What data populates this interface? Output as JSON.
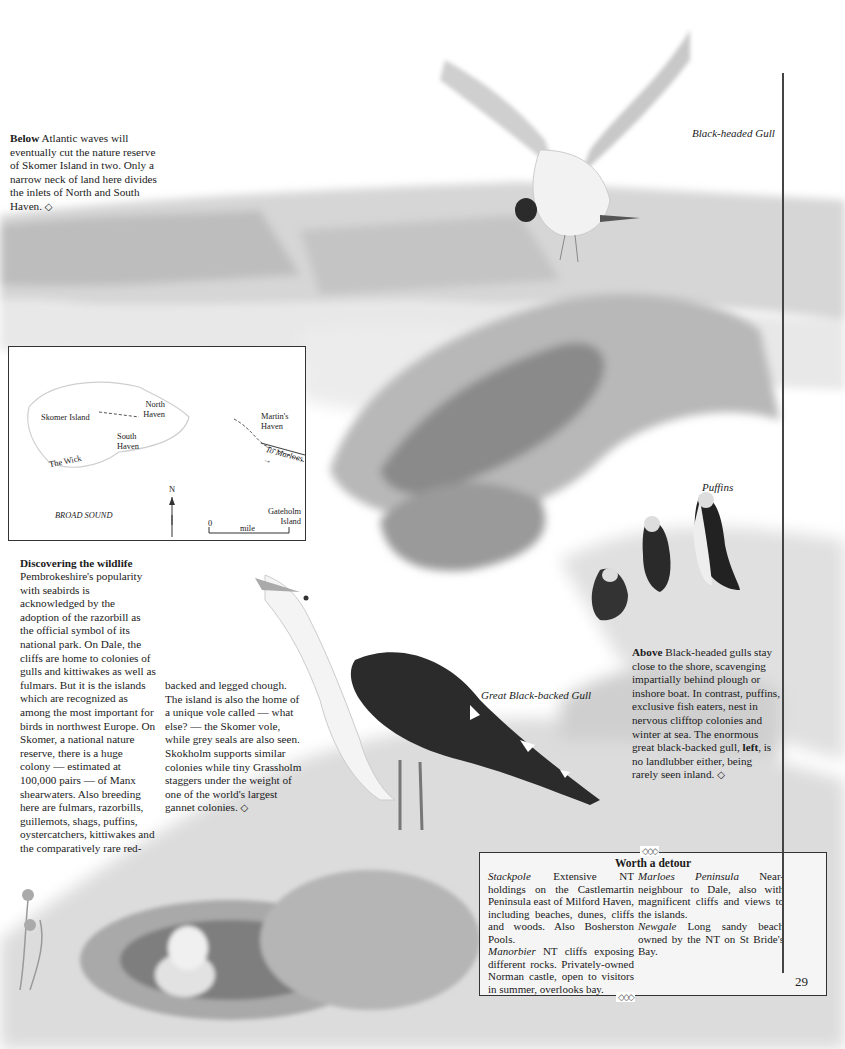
{
  "page": {
    "number": "29"
  },
  "captions": {
    "below": {
      "lead": "Below",
      "text": " Atlantic waves will eventually cut the nature reserve of Skomer Island in two. Only a narrow neck of land here divides the inlets of North and South Haven.",
      "end_mark": "◇"
    },
    "above": {
      "lead": "Above",
      "text_1": " Black-headed gulls stay close to the shore, scavenging impartially behind plough or inshore boat. In contrast, puffins, exclusive fish eaters, nest in nervous clifftop colonies and winter at sea. The enormous great black-backed gull, ",
      "bold_word": "left",
      "text_2": ", is no landlubber either, being rarely seen inland.",
      "end_mark": "◇"
    }
  },
  "illustration_labels": {
    "black_headed_gull": "Black-headed Gull",
    "puffins": "Puffins",
    "great_black_backed_gull": "Great Black-backed Gull"
  },
  "map": {
    "labels": {
      "skomer_island": "Skomer Island",
      "north_haven": "North Haven",
      "south_haven": "South Haven",
      "the_wick": "The Wick",
      "martins_haven": "Martin's Haven",
      "to_marloes": "To Marloes →",
      "broad_sound": "BROAD SOUND",
      "gateholm_island": "Gateholm Island",
      "north": "N",
      "scale_zero": "0",
      "scale_one": "1",
      "scale_unit": "mile"
    }
  },
  "article": {
    "heading": "Discovering the wildlife",
    "col1": "Pembrokeshire's popularity with seabirds is acknowledged by the adoption of the razorbill as the official symbol of its national park. On Dale, the cliffs are home to colonies of gulls and kittiwakes as well as fulmars. But it is the islands which are recognized as among the most important for birds in northwest Europe. On Skomer, a national nature reserve, there is a huge colony — estimated at 100,000 pairs — of Manx shearwaters. Also breeding here are fulmars, razorbills, guillemots, shags, puffins, oystercatchers, kittiwakes and the comparatively rare red-",
    "col2": "backed and legged chough. The island is also the home of a unique vole called — what else? — the Skomer vole, while grey seals are also seen. Skokholm supports similar colonies while tiny Grassholm staggers under the weight of one of the world's largest gannet colonies.",
    "end_mark": "◇"
  },
  "detour": {
    "title": "Worth a detour",
    "ornament": "◇◇◇",
    "entries": [
      {
        "name": "Stackpole",
        "text": " Extensive NT holdings on the Castlemartin Peninsula east of Milford Haven, including beaches, dunes, cliffs and woods. Also Bosherston Pools."
      },
      {
        "name": "Manorbier",
        "text": " NT cliffs exposing different rocks. Privately-owned Norman castle, open to visitors in summer, overlooks bay."
      },
      {
        "name": "Marloes Peninsula",
        "text": " Near-neighbour to Dale, also with magnificent cliffs and views to the islands."
      },
      {
        "name": "Newgale",
        "text": " Long sandy beach owned by the NT on St Bride's Bay."
      }
    ]
  }
}
